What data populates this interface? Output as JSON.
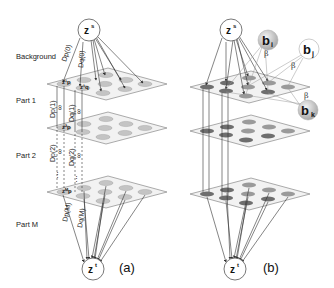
{
  "figure": {
    "panel_a": {
      "label": "(a)",
      "source_node": "z",
      "source_sup": "s",
      "target_node": "z",
      "target_sup": "t",
      "layer_labels": [
        "Background",
        "Part 1",
        "Part 2",
        "Part M"
      ],
      "edge_labels": {
        "dp0": "Dp(0)",
        "dq0": "Dq(0)",
        "dp1": "Dp(1)",
        "dq1": "Dq(1)",
        "dp2": "Dp(2)",
        "dq2": "Dq(2)",
        "dpM": "Dp(M)",
        "dqM": "Dq(M)"
      },
      "plane_nodes": {
        "p1": "z¹p",
        "q1": "z¹q",
        "p2": "z²p",
        "pM": "zᴹp"
      },
      "infinity_symbol": "∞",
      "ellipsis": "⋮"
    },
    "panel_b": {
      "label": "(b)",
      "source_node": "z",
      "source_sup": "s",
      "target_node": "z",
      "target_sup": "t",
      "bias_nodes": [
        {
          "base": "b",
          "sub": "i"
        },
        {
          "base": "b",
          "sub": "j"
        },
        {
          "base": "b",
          "sub": "k"
        }
      ],
      "beta_label": "β"
    },
    "colors": {
      "plane_fill": "#f2f2f2",
      "plane_stroke": "#888888",
      "ellipse_light": "#c4c4c4",
      "ellipse_dark": "#6e6e6e",
      "ellipse_mid": "#9a9a9a",
      "edge": "#333333",
      "bias_node": "#c8c8c8"
    }
  }
}
